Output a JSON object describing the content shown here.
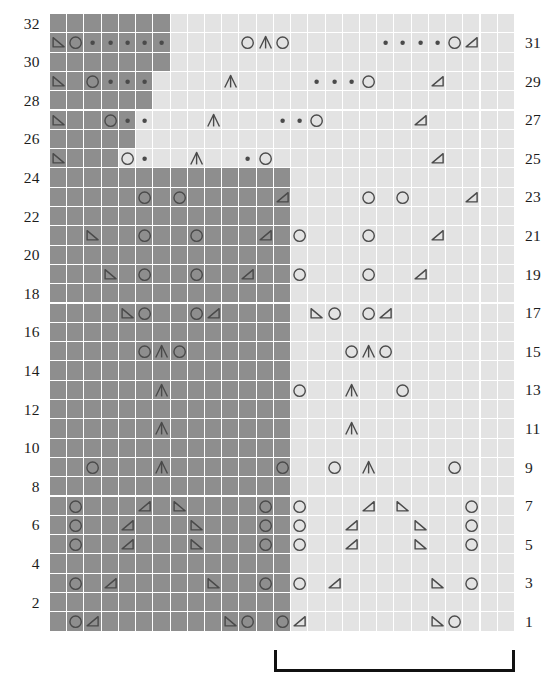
{
  "chart_data": {
    "type": "table",
    "rows": 32,
    "columns": 27,
    "row_labels_left": [
      "32",
      "30",
      "28",
      "26",
      "24",
      "22",
      "20",
      "18",
      "16",
      "14",
      "12",
      "10",
      "8",
      "6",
      "4",
      "2"
    ],
    "row_labels_right": [
      "31",
      "29",
      "27",
      "25",
      "23",
      "21",
      "19",
      "17",
      "15",
      "13",
      "11",
      "9",
      "7",
      "5",
      "3",
      "1"
    ],
    "colors": {
      "dark_cell": "#8e8e8e",
      "light_cell": "#e3e3e3",
      "grid_line": "#ffffff",
      "symbol": "#4a4a4a",
      "label_text": "#1c1c1c",
      "bracket": "#111111",
      "background": "#ffffff"
    },
    "legend": {
      "circle": "yarn over",
      "dot": "purl",
      "tri-left": "left-leaning decrease",
      "tri-right": "right-leaning decrease",
      "chevron": "centered double decrease",
      "blank": "knit"
    },
    "shading_note": "Dark cells mark the textured ground; light cells mark the lace panel.",
    "bracket": {
      "label": "",
      "start_column": 14,
      "end_column": 27
    },
    "grid": [
      {
        "row": "32",
        "shade": "ddddddd....................",
        "sym": "..........................."
      },
      {
        "row": "31",
        "shade": "ddddddd....................",
        "sym": "TOooooo....O^O.....ooooOU.."
      },
      {
        "row": "30",
        "shade": "ddddddd....................",
        "sym": "..........................."
      },
      {
        "row": "29",
        "shade": "dddddd.....................",
        "sym": "T.Oooo....^....oooO...U...."
      },
      {
        "row": "28",
        "shade": "dddddd.....................",
        "sym": "..........................."
      },
      {
        "row": "27",
        "shade": "ddddd......................",
        "sym": "T..Ooo...^...ooO.....U....."
      },
      {
        "row": "26",
        "shade": "ddddd......................",
        "sym": "..........................."
      },
      {
        "row": "25",
        "shade": "dddd.......................",
        "sym": "T...Oo..^..oO.........U...."
      },
      {
        "row": "24",
        "shade": "dddddddddddddd.............",
        "sym": "..........................."
      },
      {
        "row": "23",
        "shade": "dddddddddddddd.............",
        "sym": ".....O.O.....U....O.O...U.."
      },
      {
        "row": "22",
        "shade": "dddddddddddddd.............",
        "sym": "..........................."
      },
      {
        "row": "21",
        "shade": "dddddddddddddd.............",
        "sym": "..T..O..O...U.O...O...U...."
      },
      {
        "row": "20",
        "shade": "dddddddddddddd.............",
        "sym": "..........................."
      },
      {
        "row": "19",
        "shade": "dddddddddddddd.............",
        "sym": "...T.O..O..U..O...O..U....."
      },
      {
        "row": "18",
        "shade": "dddddddddddddd.............",
        "sym": "..........................."
      },
      {
        "row": "17",
        "shade": "dddddddddddddd.............",
        "sym": "....TO..OU.....TO.OU......."
      },
      {
        "row": "16",
        "shade": "dddddddddddddd.............",
        "sym": "..........................."
      },
      {
        "row": "15",
        "shade": "dddddddddddddd.............",
        "sym": ".....O^O.........O^O......."
      },
      {
        "row": "14",
        "shade": "dddddddddddddd.............",
        "sym": "..........................."
      },
      {
        "row": "13",
        "shade": "dddddddddddddd.............",
        "sym": "......^.......O..^..O......"
      },
      {
        "row": "12",
        "shade": "dddddddddddddd.............",
        "sym": "..........................."
      },
      {
        "row": "11",
        "shade": "dddddddddddddd.............",
        "sym": "......^..........^........."
      },
      {
        "row": "10",
        "shade": "dddddddddddddd.............",
        "sym": "..........................."
      },
      {
        "row": "9",
        "shade": "dddddddddddddd.............",
        "sym": "..O...^......O..O.^....O..."
      },
      {
        "row": "8",
        "shade": "dddddddddddddd.............",
        "sym": "..........................."
      },
      {
        "row": "7",
        "shade": "dddddddddddddd.............",
        "sym": ".O...U.T....O.O...U.T...O.."
      },
      {
        "row": "6",
        "shade": "dddddddddddddd.............",
        "sym": ".O..U...T...O.O..U...T..O.."
      },
      {
        "row": "5",
        "shade": "dddddddddddddd.............",
        "sym": ".O..U...T...O.O..U...T..O.."
      },
      {
        "row": "4",
        "shade": "dddddddddddddd.............",
        "sym": "..........................."
      },
      {
        "row": "3",
        "shade": "dddddddddddddd.............",
        "sym": ".O.U.....T..O.O.U.....T.O.."
      },
      {
        "row": "2",
        "shade": "dddddddddddddd.............",
        "sym": "..........................."
      },
      {
        "row": "1",
        "shade": "dddddddddddddd.............",
        "sym": ".OU.......TO.OU.......TO..."
      }
    ]
  }
}
